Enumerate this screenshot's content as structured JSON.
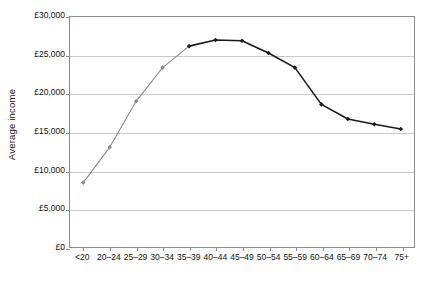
{
  "chart_data": {
    "type": "line",
    "title": "",
    "xlabel": "",
    "ylabel": "Average income",
    "categories": [
      "<20",
      "20–24",
      "25–29",
      "30–34",
      "35–39",
      "40–44",
      "45–49",
      "50–54",
      "55–59",
      "60–64",
      "65–69",
      "70–74",
      "75+"
    ],
    "values": [
      8400,
      13000,
      19000,
      23400,
      26200,
      27000,
      26900,
      25300,
      23400,
      18600,
      16700,
      16000,
      15400
    ],
    "series": [
      {
        "name": "Average income",
        "values": [
          8400,
          13000,
          19000,
          23400,
          26200,
          27000,
          26900,
          25300,
          23400,
          18600,
          16700,
          16000,
          15400
        ]
      }
    ],
    "ylim": [
      0,
      30000
    ],
    "ytick_values": [
      0,
      5000,
      10000,
      15000,
      20000,
      25000,
      30000
    ],
    "ytick_labels": [
      "£0",
      "£5,000",
      "£10,000",
      "£15,000",
      "£20,000",
      "£25,000",
      "£30,000"
    ],
    "grid": true,
    "grid_axis": "y",
    "legend": "none",
    "marker": "diamond",
    "line_colors": {
      "rising_segment": "#8a8a8a",
      "peak_and_decline_segment": "#1a1a1a"
    }
  },
  "colors": {
    "axis": "#8c8c8c",
    "gridline": "#c9c9c9",
    "text": "#111111",
    "background": "#ffffff"
  }
}
